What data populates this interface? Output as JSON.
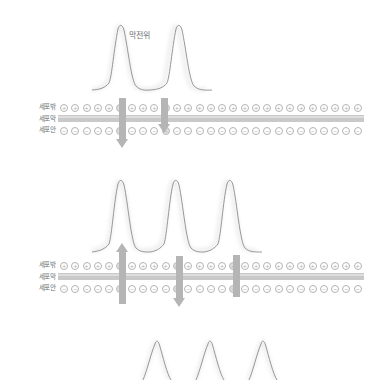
{
  "figure": {
    "title": "막전위",
    "row_labels": [
      "세포밖",
      "세포막",
      "세포안"
    ],
    "ion_sign_outer": "+",
    "ion_sign_inner": "−",
    "ion_count_per_row": 27,
    "colors": {
      "membrane": "#c9c9c9",
      "membrane_highlight": "#dedede",
      "ion_stroke": "#b3b3b3",
      "ion_fill_open": "#dcdcdc",
      "channel": "#b5b5b5",
      "trace": "#8c8c8c",
      "text": "#6d6e71",
      "background": "#ffffff"
    }
  },
  "sections": [
    {
      "name": "section-1",
      "spikes": 2,
      "channels": [
        {
          "type": "arrow-down",
          "label": "influx-channel-1"
        },
        {
          "type": "arrow-down",
          "label": "influx-channel-2"
        }
      ]
    },
    {
      "name": "section-2",
      "spikes": 3,
      "channels": [
        {
          "type": "arrow-up",
          "label": "efflux-channel-1"
        },
        {
          "type": "arrow-down",
          "label": "influx-channel-3"
        },
        {
          "type": "bar",
          "label": "closed-channel-1"
        }
      ]
    },
    {
      "name": "section-3",
      "spikes": 3,
      "channels": []
    }
  ],
  "chart_data": {
    "type": "line",
    "title": "막전위",
    "xlabel": "",
    "ylabel": "",
    "series": [
      {
        "name": "membrane-potential-trace-1",
        "peak_x": [
          118,
          173
        ],
        "peak_count": 2,
        "baseline_y": 88,
        "peak_top_y": 27
      },
      {
        "name": "membrane-potential-trace-2",
        "peak_x": [
          124,
          178,
          228
        ],
        "peak_count": 3,
        "baseline_y": 253,
        "peak_top_y": 186
      },
      {
        "name": "membrane-potential-trace-3",
        "peak_x": [
          152,
          205,
          255
        ],
        "peak_count": 3,
        "baseline_y": 378,
        "peak_top_y": 344
      }
    ]
  }
}
